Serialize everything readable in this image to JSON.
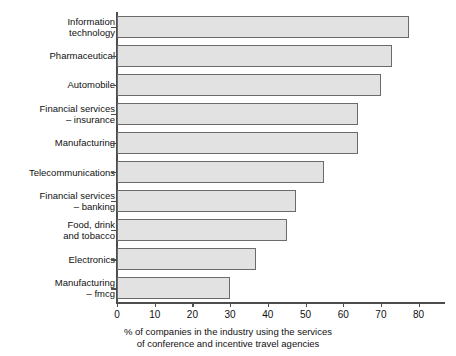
{
  "chart_data": {
    "type": "bar",
    "orientation": "horizontal",
    "title": "",
    "subtitle": "",
    "xlabel": "% of companies in the industry using the services\nof conference and incentive travel agencies",
    "ylabel": "",
    "categories": [
      "Information\ntechnology",
      "Pharmaceutical",
      "Automobile",
      "Financial services\n– insurance",
      "Manufacturing",
      "Telecommunications",
      "Financial services\n– banking",
      "Food, drink\nand tobacco",
      "Electronics",
      "Manufacturing\n– fmcg"
    ],
    "values": [
      77.5,
      73,
      70,
      64,
      64,
      55,
      47.5,
      45,
      37,
      30
    ],
    "xlim": [
      0,
      87
    ],
    "ylim": [
      0,
      10
    ],
    "xticks": [
      0,
      10,
      20,
      30,
      40,
      50,
      60,
      70,
      80
    ],
    "xtick_labels": [
      "0",
      "10",
      "20",
      "30",
      "40",
      "50",
      "60",
      "70",
      "80"
    ],
    "grid": false,
    "legend": null,
    "bar_fill_color": "#e2e2e2",
    "bar_border_color": "#6b6b6b",
    "axis_color": "#4d4d4d",
    "background_color": "#ffffff"
  }
}
